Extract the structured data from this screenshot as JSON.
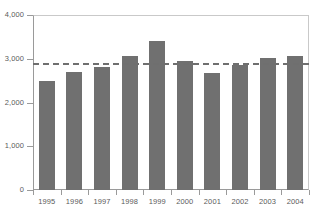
{
  "chart_data": {
    "type": "bar",
    "title": "",
    "subtitle": "",
    "xlabel": "",
    "ylabel": "",
    "categories": [
      "1995",
      "1996",
      "1997",
      "1998",
      "1999",
      "2000",
      "2001",
      "2002",
      "2003",
      "2004"
    ],
    "values": [
      2500,
      2700,
      2820,
      3060,
      3400,
      2950,
      2670,
      2850,
      3020,
      3070
    ],
    "series": [
      {
        "name": "",
        "values": [
          2500,
          2700,
          2820,
          3060,
          3400,
          2950,
          2670,
          2850,
          3020,
          3070
        ]
      }
    ],
    "ylim": [
      0,
      4000
    ],
    "ytick_values": [
      0,
      1000,
      2000,
      3000,
      4000
    ],
    "ytick_labels": [
      "0",
      "1,000",
      "2,000",
      "3,000",
      "4,000"
    ],
    "grid": false,
    "legend": null,
    "legend_position": "none",
    "bar_color": "#707070",
    "axis_color": "#9a9a9a",
    "tick_label_color": "#5b5b5b",
    "annotations": [
      {
        "type": "reference-line",
        "orientation": "horizontal",
        "value": 2900,
        "style": "dashed",
        "color": "#6f6f6f",
        "label": ""
      }
    ]
  }
}
